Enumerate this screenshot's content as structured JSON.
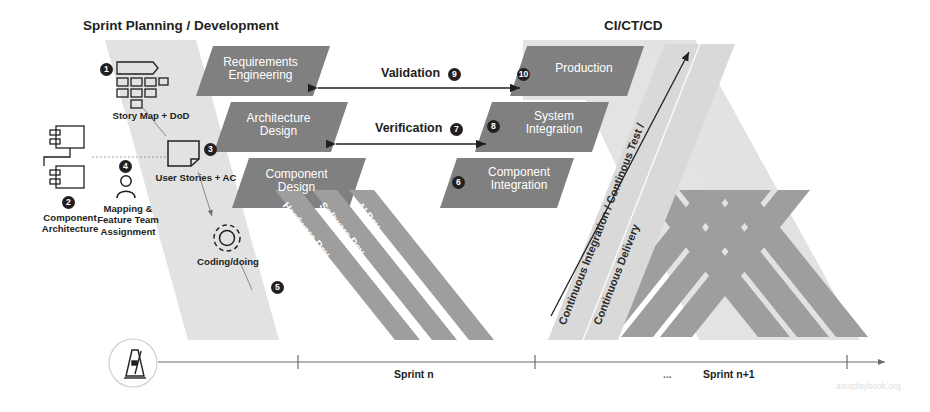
{
  "figure": {
    "title_left": "Sprint Planning / Development",
    "title_right": "CI/CT/CD",
    "watermark": "asotplaybook.org"
  },
  "colors": {
    "stage_fill": "#808080",
    "panel_fill": "#e2e2e2",
    "band_fill": "#9e9e9e",
    "band_light": "#e2e2e2",
    "ink": "#231f20",
    "axis": "#6d6d6d",
    "marker_bg": "#231f20",
    "marker_text": "#ffffff"
  },
  "left_artifacts": [
    {
      "number": "2",
      "label": "Component\nArchitecture",
      "icon": "component-architecture-icon"
    },
    {
      "number": "4",
      "label": "Mapping &\nFeature Team\nAssignment",
      "icon": "person-icon"
    },
    {
      "number": "1",
      "label": "Story Map + DoD",
      "icon": "story-map-icon"
    },
    {
      "number": "3",
      "label": "User Stories + AC",
      "icon": "note-card-icon"
    },
    {
      "number": "5",
      "label": "Coding/doing",
      "icon": "gear-icon"
    }
  ],
  "left_stages": [
    {
      "label": "Requirements\nEngineering"
    },
    {
      "label": "Architecture\nDesign"
    },
    {
      "label": "Component\nDesign"
    }
  ],
  "right_stages": [
    {
      "number": "10",
      "label": "Production"
    },
    {
      "number": "8",
      "label": "System\nIntegration"
    },
    {
      "number": "6",
      "label": "Component\nIntegration"
    }
  ],
  "dev_bands": [
    {
      "label": "Hardware Dev."
    },
    {
      "label": "Software Dev."
    },
    {
      "label": "AI Dev."
    }
  ],
  "cicd_band": {
    "line1": "Continuous Integration / Continous Test /",
    "line2": "Continuous Delivery"
  },
  "relations": [
    {
      "number": "9",
      "label": "Validation",
      "type": "double-arrow"
    },
    {
      "number": "7",
      "label": "Verification",
      "type": "double-arrow"
    }
  ],
  "timeline": {
    "icon": "metronome-icon",
    "sprint_current": "Sprint n",
    "ellipsis": "...",
    "sprint_next": "Sprint n+1"
  }
}
